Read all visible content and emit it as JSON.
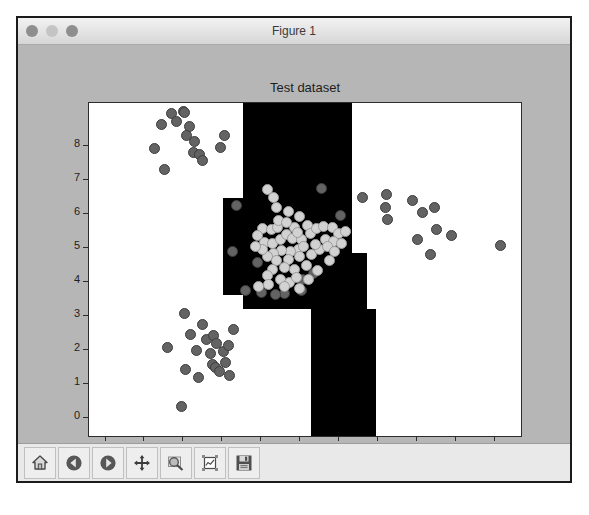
{
  "window": {
    "title": "Figure 1",
    "controls": [
      {
        "name": "close-button",
        "color": "#8e8e8e"
      },
      {
        "name": "minimize-button",
        "color": "#c4c4c4"
      },
      {
        "name": "zoom-button",
        "color": "#8e8e8e"
      }
    ]
  },
  "toolbar": {
    "buttons": [
      {
        "name": "home-button",
        "icon": "home-icon",
        "tooltip": "Reset original view"
      },
      {
        "name": "back-button",
        "icon": "left-arrow-icon",
        "tooltip": "Back to previous view"
      },
      {
        "name": "forward-button",
        "icon": "right-arrow-icon",
        "tooltip": "Forward to next view"
      },
      {
        "name": "pan-button",
        "icon": "move-cross-icon",
        "tooltip": "Pan axes with left mouse, zoom with right"
      },
      {
        "name": "zoom-button",
        "icon": "magnifier-rect-icon",
        "tooltip": "Zoom to rectangle"
      },
      {
        "name": "configure-subplots-button",
        "icon": "subplots-icon",
        "tooltip": "Configure subplots"
      },
      {
        "name": "save-button",
        "icon": "floppy-disk-icon",
        "tooltip": "Save the figure"
      }
    ]
  },
  "chart_data": {
    "type": "scatter",
    "title": "Test dataset",
    "xlabel": "",
    "ylabel": "",
    "xlim": [
      -0.4,
      10.7
    ],
    "ylim": [
      -0.55,
      9.25
    ],
    "xticks": [
      0,
      1,
      2,
      3,
      4,
      5,
      6,
      7,
      8,
      9,
      10
    ],
    "yticks": [
      0,
      1,
      2,
      3,
      4,
      5,
      6,
      7,
      8
    ],
    "grid": false,
    "legend": null,
    "background": "#ffffff",
    "region_color": "#000000",
    "point_colors": {
      "dark": "#636363",
      "light": "#d2d2d2"
    },
    "decision_regions": [
      {
        "label": "class-1",
        "color": "#000000",
        "cells": [
          {
            "x0": 3.55,
            "x1": 6.35,
            "y0": 6.45,
            "y1": 9.25
          },
          {
            "x0": 3.05,
            "x1": 6.35,
            "y0": 4.85,
            "y1": 6.45
          },
          {
            "x0": 3.05,
            "x1": 6.75,
            "y0": 3.6,
            "y1": 4.85
          },
          {
            "x0": 3.55,
            "x1": 6.75,
            "y0": 3.2,
            "y1": 3.6
          },
          {
            "x0": 5.3,
            "x1": 6.98,
            "y0": -0.55,
            "y1": 3.2
          }
        ]
      }
    ],
    "series": [
      {
        "name": "upper-left-cluster",
        "color": "#636363",
        "points": [
          [
            1.45,
            8.62
          ],
          [
            1.72,
            8.95
          ],
          [
            1.85,
            8.72
          ],
          [
            2.02,
            9.0
          ],
          [
            2.05,
            8.98
          ],
          [
            2.18,
            8.55
          ],
          [
            2.32,
            8.12
          ],
          [
            2.28,
            7.8
          ],
          [
            2.45,
            7.72
          ],
          [
            2.52,
            7.55
          ],
          [
            1.28,
            7.92
          ],
          [
            1.55,
            7.28
          ],
          [
            2.98,
            7.95
          ],
          [
            3.08,
            8.3
          ],
          [
            2.1,
            8.3
          ]
        ]
      },
      {
        "name": "lower-left-cluster",
        "color": "#636363",
        "points": [
          [
            2.05,
            3.05
          ],
          [
            2.52,
            2.72
          ],
          [
            2.22,
            2.45
          ],
          [
            2.35,
            1.98
          ],
          [
            2.08,
            1.42
          ],
          [
            2.62,
            2.28
          ],
          [
            2.8,
            2.42
          ],
          [
            2.88,
            2.18
          ],
          [
            2.72,
            1.88
          ],
          [
            2.78,
            1.55
          ],
          [
            2.85,
            1.48
          ],
          [
            2.95,
            1.35
          ],
          [
            3.05,
            1.95
          ],
          [
            3.12,
            1.62
          ],
          [
            3.18,
            2.12
          ],
          [
            1.98,
            0.32
          ],
          [
            2.42,
            1.18
          ],
          [
            3.32,
            2.58
          ],
          [
            3.22,
            1.22
          ],
          [
            1.62,
            2.05
          ]
        ]
      },
      {
        "name": "right-cluster",
        "color": "#636363",
        "points": [
          [
            7.25,
            6.55
          ],
          [
            7.22,
            6.18
          ],
          [
            7.28,
            5.82
          ],
          [
            7.92,
            6.38
          ],
          [
            8.18,
            6.02
          ],
          [
            8.48,
            6.18
          ],
          [
            8.52,
            5.52
          ],
          [
            8.05,
            5.22
          ],
          [
            8.38,
            4.78
          ],
          [
            8.92,
            5.35
          ],
          [
            10.18,
            5.05
          ],
          [
            6.62,
            6.48
          ]
        ]
      },
      {
        "name": "center-cluster-dark",
        "color": "#636363",
        "points": [
          [
            3.38,
            6.22
          ],
          [
            3.28,
            4.88
          ],
          [
            3.62,
            3.72
          ],
          [
            4.02,
            3.68
          ],
          [
            4.62,
            3.65
          ],
          [
            5.05,
            3.72
          ],
          [
            5.58,
            6.72
          ],
          [
            5.38,
            4.22
          ],
          [
            4.38,
            3.62
          ],
          [
            5.08,
            4.05
          ],
          [
            3.92,
            4.55
          ],
          [
            6.05,
            5.95
          ]
        ]
      },
      {
        "name": "center-cluster-light",
        "color": "#d2d2d2",
        "points": [
          [
            4.18,
            6.7
          ],
          [
            4.35,
            6.48
          ],
          [
            4.72,
            6.05
          ],
          [
            5.02,
            5.92
          ],
          [
            4.88,
            5.58
          ],
          [
            5.22,
            5.65
          ],
          [
            4.05,
            5.55
          ],
          [
            4.28,
            5.52
          ],
          [
            4.45,
            5.58
          ],
          [
            3.92,
            5.35
          ],
          [
            4.12,
            5.15
          ],
          [
            4.32,
            5.12
          ],
          [
            4.52,
            5.22
          ],
          [
            4.68,
            5.38
          ],
          [
            4.82,
            5.25
          ],
          [
            5.05,
            5.22
          ],
          [
            5.28,
            5.42
          ],
          [
            5.45,
            5.55
          ],
          [
            5.62,
            5.62
          ],
          [
            5.85,
            5.58
          ],
          [
            6.02,
            5.42
          ],
          [
            6.18,
            5.48
          ],
          [
            5.68,
            5.22
          ],
          [
            5.88,
            5.18
          ],
          [
            4.98,
            4.95
          ],
          [
            4.78,
            4.88
          ],
          [
            4.55,
            4.92
          ],
          [
            4.35,
            4.82
          ],
          [
            4.18,
            4.72
          ],
          [
            4.42,
            4.62
          ],
          [
            4.72,
            4.65
          ],
          [
            5.02,
            4.72
          ],
          [
            5.32,
            4.78
          ],
          [
            5.52,
            4.95
          ],
          [
            5.72,
            5.02
          ],
          [
            4.62,
            4.42
          ],
          [
            4.88,
            4.35
          ],
          [
            5.18,
            4.48
          ],
          [
            4.32,
            4.35
          ],
          [
            4.18,
            4.18
          ],
          [
            4.52,
            4.05
          ],
          [
            4.75,
            3.98
          ],
          [
            4.92,
            4.12
          ],
          [
            5.25,
            4.05
          ],
          [
            5.48,
            4.32
          ],
          [
            5.78,
            4.62
          ],
          [
            4.05,
            4.95
          ],
          [
            3.88,
            5.02
          ],
          [
            4.48,
            5.78
          ],
          [
            4.95,
            5.45
          ],
          [
            5.12,
            5.02
          ],
          [
            5.42,
            5.08
          ],
          [
            4.22,
            3.92
          ],
          [
            4.62,
            3.85
          ],
          [
            5.02,
            3.78
          ],
          [
            3.95,
            3.85
          ],
          [
            6.08,
            5.12
          ],
          [
            5.92,
            4.88
          ],
          [
            4.68,
            5.72
          ],
          [
            4.42,
            6.18
          ]
        ]
      }
    ]
  }
}
